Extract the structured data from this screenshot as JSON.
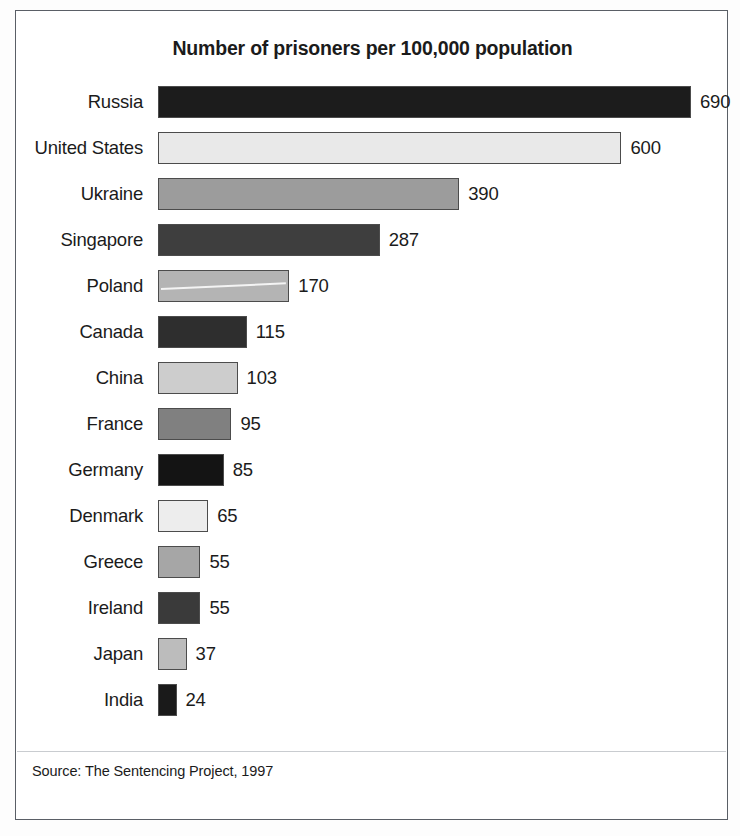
{
  "figure": {
    "title": "Number of prisoners per 100,000 population",
    "source_note": "Source: The Sentencing Project, 1997",
    "frame_color": "#5a5f66",
    "background": "#ffffff",
    "text_color": "#1b1b1b"
  },
  "chart_data": {
    "type": "bar",
    "orientation": "horizontal",
    "title": "Number of prisoners per 100,000 population",
    "subtitle": "",
    "xlabel": "",
    "ylabel": "",
    "xlim": [
      0,
      690
    ],
    "grid": false,
    "legend": "none",
    "annotations": [
      "Source: The Sentencing Project, 1997"
    ],
    "value_labels_position": "outside-right",
    "categories": [
      "Russia",
      "United States",
      "Ukraine",
      "Singapore",
      "Poland",
      "Canada",
      "China",
      "France",
      "Germany",
      "Denmark",
      "Greece",
      "Ireland",
      "Japan",
      "India"
    ],
    "values": [
      690,
      600,
      390,
      287,
      170,
      115,
      103,
      95,
      85,
      65,
      55,
      55,
      37,
      24
    ],
    "value_label_texts": [
      "690",
      "600",
      "390",
      "287",
      "170",
      "115",
      "103",
      "95",
      "85",
      "65",
      "55",
      "55",
      "37",
      "24"
    ],
    "bar_fills": [
      "#1c1c1c",
      "#e9e9e9",
      "#9c9c9c",
      "#3e3e3e",
      "#b4b4b4",
      "#2e2e2e",
      "#cdcdcd",
      "#808080",
      "#141414",
      "#ededed",
      "#a6a6a6",
      "#3a3a3a",
      "#bcbcbc",
      "#1a1a1a"
    ],
    "bar_edge_color": "#4c4c4c",
    "special_markings": [
      {
        "category": "Poland",
        "mark": "white-diagonal-scratch"
      }
    ]
  }
}
